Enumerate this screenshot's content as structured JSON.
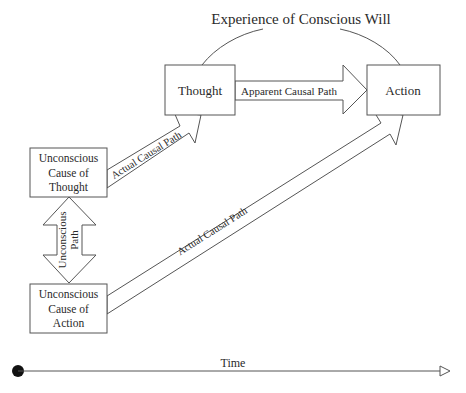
{
  "diagram": {
    "title": "Experience of Conscious Will",
    "nodes": {
      "thought": {
        "label": "Thought"
      },
      "action": {
        "label": "Action"
      },
      "unconscious_cause_thought": {
        "lines": [
          "Unconscious",
          "Cause of",
          "Thought"
        ]
      },
      "unconscious_cause_action": {
        "lines": [
          "Unconscious",
          "Cause of",
          "Action"
        ]
      }
    },
    "edges": {
      "apparent": {
        "label": "Apparent Causal Path",
        "from": "Thought",
        "to": "Action"
      },
      "actual_to_thought": {
        "label": "Actual Causal Path",
        "from": "Unconscious Cause of Thought",
        "to": "Thought"
      },
      "actual_to_action": {
        "label": "Actual Causal Path",
        "from": "Unconscious Cause of Action",
        "to": "Action"
      },
      "unconscious_path": {
        "lines": [
          "Unconscious",
          "Path"
        ],
        "from": "Unconscious Cause of Thought",
        "to": "Unconscious Cause of Action",
        "bidirectional": true
      }
    },
    "timeline": {
      "label": "Time"
    },
    "colors": {
      "stroke": "#555555",
      "text": "#2a2a2a",
      "background": "#ffffff"
    }
  }
}
